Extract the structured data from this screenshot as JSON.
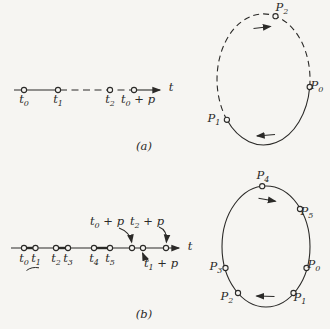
{
  "figure": {
    "type": "diagram",
    "colors": {
      "ink": "#2b2a28",
      "background": "#f6f5f2",
      "point_fill": "#f6f5f2"
    },
    "panel_a": {
      "caption": "(a)",
      "timeline": {
        "axis_label": "t",
        "ticks": [
          {
            "pre": "t",
            "sub": "0",
            "post": ""
          },
          {
            "pre": "t",
            "sub": "1",
            "post": ""
          },
          {
            "pre": "t",
            "sub": "2",
            "post": ""
          },
          {
            "pre": "t",
            "sub": "0",
            "post": " + p"
          }
        ]
      },
      "orbit": {
        "points": [
          {
            "pre": "P",
            "sub": "2"
          },
          {
            "pre": "P",
            "sub": "0"
          },
          {
            "pre": "P",
            "sub": "1"
          }
        ]
      }
    },
    "panel_b": {
      "caption": "(b)",
      "timeline": {
        "axis_label": "t",
        "ticks": [
          {
            "pre": "t",
            "sub": "0",
            "post": ""
          },
          {
            "pre": "t",
            "sub": "1",
            "post": ""
          },
          {
            "pre": "t",
            "sub": "2",
            "post": ""
          },
          {
            "pre": "t",
            "sub": "3",
            "post": ""
          },
          {
            "pre": "t",
            "sub": "4",
            "post": ""
          },
          {
            "pre": "t",
            "sub": "5",
            "post": ""
          }
        ],
        "callouts": [
          {
            "pre": "t",
            "sub": "0",
            "post": " + p"
          },
          {
            "pre": "t",
            "sub": "2",
            "post": " + p"
          },
          {
            "pre": "t",
            "sub": "1",
            "post": " + p"
          }
        ]
      },
      "orbit": {
        "points": [
          {
            "pre": "P",
            "sub": "4"
          },
          {
            "pre": "P",
            "sub": "5"
          },
          {
            "pre": "P",
            "sub": "0"
          },
          {
            "pre": "P",
            "sub": "1"
          },
          {
            "pre": "P",
            "sub": "2"
          },
          {
            "pre": "P",
            "sub": "3"
          }
        ]
      }
    }
  }
}
